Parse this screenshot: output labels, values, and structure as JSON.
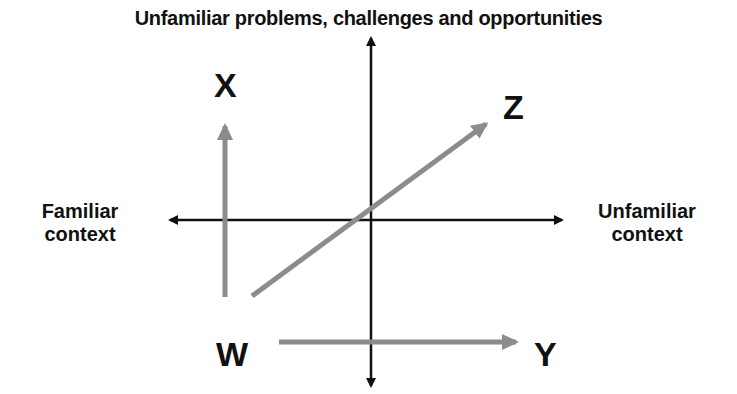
{
  "diagram": {
    "title": "Unfamiliar problems, challenges and opportunities",
    "left_label_line1": "Familiar",
    "left_label_line2": "context",
    "right_label_line1": "Unfamiliar",
    "right_label_line2": "context",
    "points": {
      "x": "X",
      "y": "Y",
      "z": "Z",
      "w": "W"
    },
    "colors": {
      "axis": "#111111",
      "vector": "#8c8c8c",
      "background": "#ffffff"
    },
    "axes": [
      {
        "name": "vertical",
        "from": [
          371,
          388
        ],
        "to": [
          371,
          36
        ],
        "bidirectional": true
      },
      {
        "name": "horizontal",
        "from": [
          168,
          220
        ],
        "to": [
          562,
          220
        ],
        "bidirectional": true
      }
    ],
    "vectors": [
      {
        "name": "W-to-X",
        "from": [
          225,
          297
        ],
        "to": [
          225,
          124
        ]
      },
      {
        "name": "W-to-Y",
        "from": [
          279,
          342
        ],
        "to": [
          518,
          342
        ]
      },
      {
        "name": "W-to-Z",
        "from": [
          252,
          296
        ],
        "to": [
          488,
          122
        ]
      }
    ]
  }
}
